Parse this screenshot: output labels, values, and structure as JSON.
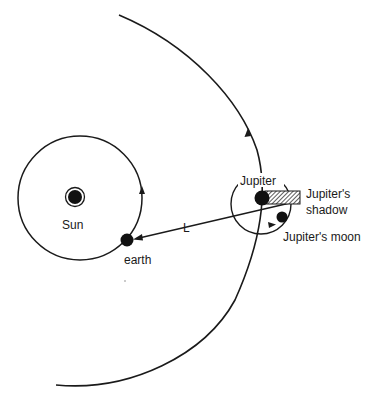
{
  "diagram": {
    "type": "astronomy-schematic",
    "colors": {
      "line": "#1a1a1a",
      "fill": "#111111",
      "background": "#ffffff",
      "shadow_hatch": "#333333"
    },
    "labels": {
      "sun": "Sun",
      "earth": "earth",
      "distance": "L",
      "jupiter": "Jupiter",
      "shadow_line1": "Jupiter's",
      "shadow_line2": "shadow",
      "moon": "Jupiter's moon"
    },
    "bodies": {
      "sun": {
        "cx": 75,
        "cy": 197,
        "r": 9
      },
      "earth": {
        "cx": 127,
        "cy": 240,
        "r": 6
      },
      "jupiter": {
        "cx": 262,
        "cy": 198,
        "r": 7
      },
      "moon": {
        "cx": 282,
        "cy": 217,
        "r": 5
      }
    },
    "orbits": {
      "earth_orbit": {
        "cx": 80,
        "cy": 198,
        "r": 62,
        "direction": "counter-clockwise"
      },
      "jupiter_orbit": {
        "shape": "large arc",
        "direction": "counter-clockwise"
      },
      "moon_orbit": {
        "cx": 261,
        "cy": 204,
        "r": 30,
        "direction": "counter-clockwise"
      }
    }
  }
}
